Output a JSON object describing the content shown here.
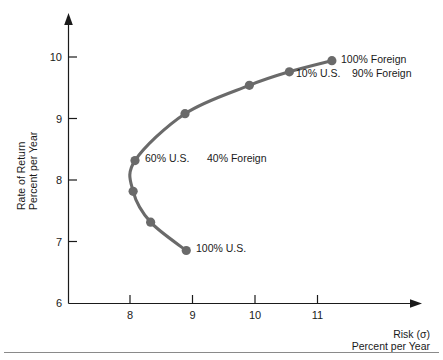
{
  "chart_data": {
    "type": "line",
    "title": "",
    "subtitle": "",
    "xlabel_line1": "Risk (σ)",
    "xlabel_line2": "Percent per Year",
    "ylabel_line1": "Rate of Return",
    "ylabel_line2": "Percent per Year",
    "xlim": [
      7.0,
      11.6
    ],
    "ylim": [
      6.0,
      10.4
    ],
    "xticks": [
      8,
      9,
      10,
      11
    ],
    "xtick_labels": [
      "8",
      "9",
      "10",
      "11"
    ],
    "yticks": [
      6,
      7,
      8,
      9,
      10
    ],
    "ytick_labels": [
      "6",
      "7",
      "8",
      "9",
      "10"
    ],
    "grid": false,
    "legend": "none",
    "series": [
      {
        "name": "US-Foreign efficient frontier",
        "color": "#6a6a6a",
        "x": [
          8.9,
          8.33,
          8.05,
          8.08,
          8.88,
          9.91,
          10.55,
          11.23
        ],
        "y": [
          6.86,
          7.32,
          7.82,
          8.32,
          9.08,
          9.54,
          9.76,
          9.94
        ]
      }
    ],
    "annotations": [
      {
        "text": "100% Foreign",
        "x": 11.23,
        "y": 9.94
      },
      {
        "text": "10% U.S.",
        "x": 10.55,
        "y": 9.76
      },
      {
        "text": "90% Foreign",
        "x": 11.23,
        "y": 9.76
      },
      {
        "text": "60% U.S.",
        "x": 8.08,
        "y": 8.32
      },
      {
        "text": "40% Foreign",
        "x": 9.05,
        "y": 8.32
      },
      {
        "text": "100% U.S.",
        "x": 8.9,
        "y": 6.86
      }
    ]
  },
  "axes": {
    "y_label_line1": "Rate of Return",
    "y_label_line2": "Percent per Year",
    "x_label_line1": "Risk (σ)",
    "x_label_line2": "Percent per Year",
    "ytick_6": "6",
    "ytick_7": "7",
    "ytick_8": "8",
    "ytick_9": "9",
    "ytick_10": "10",
    "xtick_8": "8",
    "xtick_9": "9",
    "xtick_10": "10",
    "xtick_11": "11"
  },
  "labels": {
    "foreign_100": "100% Foreign",
    "us_10": "10% U.S.",
    "foreign_90": "90% Foreign",
    "us_60": "60% U.S.",
    "foreign_40": "40% Foreign",
    "us_100": "100% U.S."
  },
  "colors": {
    "curve": "#6a6a6a",
    "marker": "#6a6a6a",
    "axis": "#1a1a1a",
    "text": "#1a1a1a",
    "background": "#ffffff",
    "footer_rule": "#8a8a8a"
  }
}
